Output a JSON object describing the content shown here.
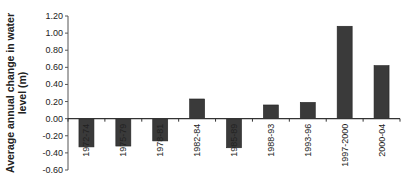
{
  "chart_data": {
    "type": "bar",
    "title": "",
    "xlabel": "",
    "ylabel": "Average annual change in water level (m)",
    "ylabel_lines": [
      "Average annual change in water",
      "level (m)"
    ],
    "categories": [
      "1972-74",
      "1975-79",
      "1978-81",
      "1982-84",
      "1985-89",
      "1988-93",
      "1993-96",
      "1997-2000",
      "2000-04"
    ],
    "values": [
      -0.33,
      -0.32,
      -0.26,
      0.23,
      -0.34,
      0.16,
      0.19,
      1.08,
      0.62
    ],
    "ylim": [
      -0.6,
      1.2
    ],
    "yticks": [
      1.2,
      1.0,
      0.8,
      0.6,
      0.4,
      0.2,
      0.0,
      -0.2,
      -0.4,
      -0.6
    ],
    "ytick_labels": [
      "1.20",
      "1.00",
      "0.80",
      "0.60",
      "0.40",
      "0.20",
      "0.00",
      "-0.20",
      "-0.40",
      "-0.60"
    ],
    "grid": false,
    "legend": null,
    "bar_color": "#3a3a3a"
  }
}
